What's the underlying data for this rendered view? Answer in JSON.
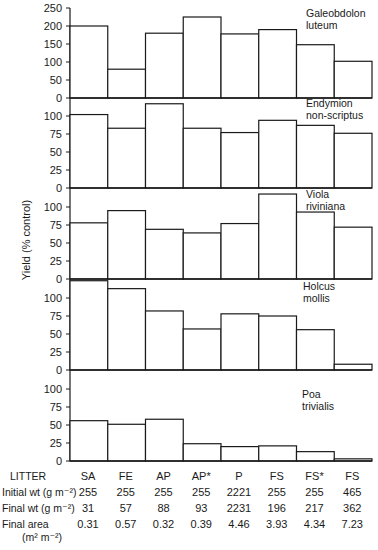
{
  "chart_data": {
    "type": "bar",
    "title": "",
    "ylabel": "Yield (% control)",
    "xlabel": "LITTER",
    "categories": [
      "SA",
      "FE",
      "AP",
      "AP*",
      "P",
      "FS",
      "FS*",
      "FS"
    ],
    "grid": false,
    "panels": [
      {
        "species": [
          "Galeobdolon",
          "luteum"
        ],
        "ylim": [
          0,
          250
        ],
        "yticks": [
          0,
          50,
          100,
          150,
          200,
          250
        ],
        "values": [
          200,
          80,
          180,
          225,
          178,
          190,
          148,
          102
        ]
      },
      {
        "species": [
          "Endymion",
          "non-scriptus"
        ],
        "ylim": [
          0,
          100
        ],
        "yticks": [
          0,
          25,
          50,
          75,
          100
        ],
        "values": [
          102,
          83,
          117,
          83,
          77,
          94,
          87,
          76
        ]
      },
      {
        "species": [
          "Viola",
          "riviniana"
        ],
        "ylim": [
          0,
          100
        ],
        "yticks": [
          0,
          25,
          50,
          75,
          100
        ],
        "values": [
          78,
          95,
          69,
          64,
          77,
          118,
          93,
          72
        ]
      },
      {
        "species": [
          "Holcus",
          "mollis"
        ],
        "ylim": [
          0,
          100
        ],
        "yticks": [
          0,
          25,
          50,
          75,
          100
        ],
        "values": [
          124,
          113,
          82,
          57,
          78,
          75,
          56,
          8
        ]
      },
      {
        "species": [
          "Poa",
          "trivialis"
        ],
        "ylim": [
          0,
          100
        ],
        "yticks": [
          0,
          25,
          50,
          75,
          100
        ],
        "values": [
          56,
          51,
          58,
          24,
          20,
          21,
          13,
          3
        ]
      }
    ],
    "table": {
      "header_label": "LITTER",
      "columns": [
        "SA",
        "FE",
        "AP",
        "AP*",
        "P",
        "FS",
        "FS*",
        "FS"
      ],
      "rows": [
        {
          "label": "Initial wt (g m⁻²)",
          "values": [
            "255",
            "255",
            "255",
            "255",
            "2221",
            "255",
            "255",
            "465"
          ]
        },
        {
          "label": "Final wt (g m⁻²)",
          "values": [
            "31",
            "57",
            "88",
            "93",
            "2231",
            "196",
            "217",
            "362"
          ]
        },
        {
          "label": "Final area",
          "label2": "(m² m⁻²)",
          "values": [
            "0.31",
            "0.57",
            "0.32",
            "0.39",
            "4.46",
            "3.93",
            "4.34",
            "7.23"
          ]
        }
      ]
    }
  }
}
